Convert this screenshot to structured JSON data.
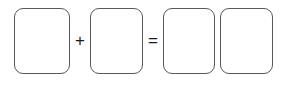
{
  "canvas": {
    "width": 287,
    "height": 88,
    "background_color": "#ffffff"
  },
  "diagram": {
    "kind": "equation-with-empty-boxes",
    "expression": "[ ] + [ ] = [ ] [ ]",
    "stroke_color": "#595959",
    "fill_color": "#ffffff",
    "operator_color": "#1a1a1a",
    "stroke_width": 1.4,
    "corner_radius": 9
  },
  "boxes": [
    {
      "id": "addend-1",
      "label": "",
      "role": "addend",
      "x": 14,
      "y": 8,
      "width": 56,
      "height": 66
    },
    {
      "id": "addend-2",
      "label": "",
      "role": "addend",
      "x": 90,
      "y": 8,
      "width": 53,
      "height": 66
    },
    {
      "id": "sum-tens",
      "label": "",
      "role": "sum-part",
      "x": 163,
      "y": 8,
      "width": 52,
      "height": 66
    },
    {
      "id": "sum-ones",
      "label": "",
      "role": "sum-part",
      "x": 220,
      "y": 8,
      "width": 53,
      "height": 66
    }
  ],
  "operators": [
    {
      "id": "plus",
      "symbol": "+",
      "name": "plus-sign",
      "x": 71,
      "y": 31,
      "width": 18,
      "height": 18
    },
    {
      "id": "equals",
      "symbol": "=",
      "name": "equals-sign",
      "x": 144,
      "y": 31,
      "width": 18,
      "height": 18
    }
  ]
}
